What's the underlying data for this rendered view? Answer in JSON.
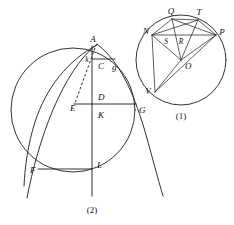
{
  "figure": {
    "background_color": "#ffffff",
    "stroke_color": "#1b1b1b",
    "width": 234,
    "height": 225
  },
  "diagram_1": {
    "caption": "(1)",
    "description": "Circle with center O, chord NP, points Q and T on the upper arc, V on the lower left arc, and interior intersection points S and R on chord NP",
    "labels": {
      "Q": "Q",
      "T": "T",
      "N": "N",
      "P": "P",
      "S": "S",
      "R": "R",
      "O": "O",
      "V": "V"
    },
    "points": [
      {
        "name": "Q",
        "x": 172,
        "y": 16
      },
      {
        "name": "T",
        "x": 199,
        "y": 17
      },
      {
        "name": "N",
        "x": 150,
        "y": 34
      },
      {
        "name": "P",
        "x": 217,
        "y": 33
      },
      {
        "name": "S",
        "x": 166,
        "y": 39
      },
      {
        "name": "R",
        "x": 181,
        "y": 39
      },
      {
        "name": "O",
        "x": 182,
        "y": 64
      },
      {
        "name": "V",
        "x": 154,
        "y": 90
      }
    ],
    "circle": {
      "cx": 181,
      "cy": 60,
      "r": 45
    }
  },
  "diagram_2": {
    "caption": "(2)",
    "description": "Large circle crossed by a parabola through F, A and G, with vertical axis through A, C, D, K, L and horizontal chords",
    "labels": {
      "A": "A",
      "k": "k",
      "C": "C",
      "g": "g",
      "D": "D",
      "E": "E",
      "K": "K",
      "G": "G",
      "F": "F",
      "L": "L"
    },
    "points": [
      {
        "name": "A",
        "x": 97,
        "y": 44
      },
      {
        "name": "k",
        "x": 90,
        "y": 62
      },
      {
        "name": "C",
        "x": 97,
        "y": 67
      },
      {
        "name": "g",
        "x": 111,
        "y": 68
      },
      {
        "name": "D",
        "x": 97,
        "y": 97
      },
      {
        "name": "E",
        "x": 79,
        "y": 106
      },
      {
        "name": "K",
        "x": 97,
        "y": 112
      },
      {
        "name": "G",
        "x": 138,
        "y": 110
      },
      {
        "name": "F",
        "x": 42,
        "y": 170
      },
      {
        "name": "L",
        "x": 97,
        "y": 168
      }
    ],
    "circle": {
      "cx": 73,
      "cy": 110,
      "r": 62
    }
  }
}
